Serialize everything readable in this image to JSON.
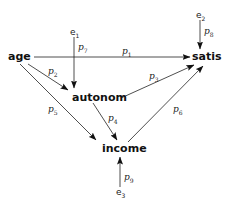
{
  "diagram": {
    "type": "path-diagram",
    "nodes": {
      "age": "age",
      "autonom": "autonom",
      "income": "income",
      "satis": "satis"
    },
    "errors": {
      "e1": {
        "base": "e",
        "sub": "1"
      },
      "e2": {
        "base": "e",
        "sub": "2"
      },
      "e3": {
        "base": "e",
        "sub": "3"
      }
    },
    "paths": {
      "p1": {
        "base": "p",
        "sub": "1",
        "from": "age",
        "to": "satis"
      },
      "p2": {
        "base": "p",
        "sub": "2",
        "from": "age",
        "to": "autonom"
      },
      "p3": {
        "base": "p",
        "sub": "3",
        "from": "autonom",
        "to": "satis"
      },
      "p4": {
        "base": "p",
        "sub": "4",
        "from": "autonom",
        "to": "income"
      },
      "p5": {
        "base": "p",
        "sub": "5",
        "from": "age",
        "to": "income"
      },
      "p6": {
        "base": "p",
        "sub": "6",
        "from": "income",
        "to": "satis"
      },
      "p7": {
        "base": "p",
        "sub": "7",
        "from": "e1",
        "to": "autonom"
      },
      "p8": {
        "base": "p",
        "sub": "8",
        "from": "e2",
        "to": "satis"
      },
      "p9": {
        "base": "p",
        "sub": "9",
        "from": "e3",
        "to": "income"
      }
    },
    "colors": {
      "line": "#222222",
      "text": "#111111",
      "background": "#ffffff"
    }
  }
}
